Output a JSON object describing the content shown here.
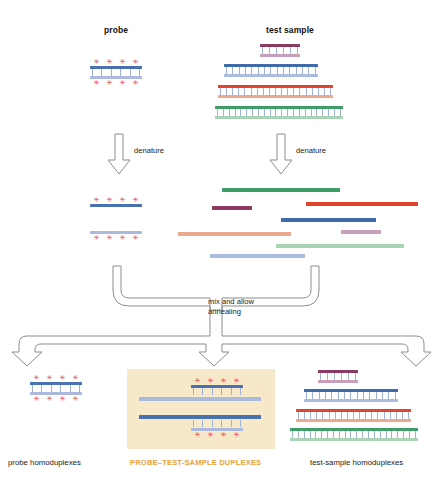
{
  "diagram": {
    "title_probe": "probe",
    "title_test_sample": "test sample",
    "denature_label_left": "denature",
    "denature_label_right": "denature",
    "mix_label_line1": "mix and allow",
    "mix_label_line2": "annealing",
    "result_label_left": "probe homoduplexes",
    "result_label_center": "PROBE–TEST-SAMPLE DUPLEXES",
    "result_label_right": "test-sample homoduplexes"
  },
  "colors": {
    "probe_top_strand": "#4a72b0",
    "probe_bottom_strand": "#aab9dd",
    "star_marker": "#e0484a",
    "rung": "#9fb4d4",
    "purple_top": "#8b3a62",
    "purple_bottom": "#c9a0bc",
    "blue_top": "#3f6bab",
    "blue_bottom": "#a9bcdf",
    "red_top": "#e0452c",
    "red_bottom": "#eda88e",
    "green_top": "#3f9e68",
    "green_bottom": "#a8d3b4",
    "arrow_stroke": "#8d8d8d",
    "highlight_panel_bg": "#f6e8c8",
    "highlight_label": "#e8a33d",
    "text": "#1a1a1a",
    "background": "#ffffff"
  },
  "top": {
    "probe_duplex": {
      "name": "probe-duplex",
      "width": 52,
      "rungs": 6,
      "stars_top": 4,
      "stars_bottom": 4
    },
    "test_sample_duplexes": [
      {
        "name": "purple-duplex",
        "width": 40,
        "rungs": 6,
        "top_color": "purple_top",
        "bottom_color": "purple_bottom"
      },
      {
        "name": "blue-duplex",
        "width": 94,
        "rungs": 15,
        "top_color": "blue_top",
        "bottom_color": "blue_bottom"
      },
      {
        "name": "red-duplex",
        "width": 115,
        "rungs": 19,
        "top_color": "red_top",
        "bottom_color": "red_bottom"
      },
      {
        "name": "green-duplex",
        "width": 128,
        "rungs": 22,
        "top_color": "green_top",
        "bottom_color": "green_bottom"
      }
    ]
  },
  "denatured": {
    "probe_strands": [
      {
        "name": "probe-top-single",
        "color": "probe_top_strand",
        "stars": 4,
        "stars_position": "above"
      },
      {
        "name": "probe-bottom-single",
        "color": "probe_bottom_strand",
        "stars": 4,
        "stars_position": "below"
      }
    ],
    "test_sample_strands": [
      {
        "name": "green-top-single",
        "color": "green_top",
        "x": 222,
        "y": 188,
        "width": 118
      },
      {
        "name": "purple-top-single",
        "color": "purple_top",
        "x": 212,
        "y": 206,
        "width": 40
      },
      {
        "name": "red-top-single",
        "color": "red_top",
        "x": 306,
        "y": 202,
        "width": 112
      },
      {
        "name": "blue-top-single",
        "color": "blue_top",
        "x": 281,
        "y": 218,
        "width": 95
      },
      {
        "name": "purple-bot-single",
        "color": "purple_bottom",
        "x": 341,
        "y": 230,
        "width": 40
      },
      {
        "name": "red-bot-single",
        "color": "red_bottom",
        "x": 178,
        "y": 232,
        "width": 113
      },
      {
        "name": "green-bot-single",
        "color": "green_bottom",
        "x": 276,
        "y": 244,
        "width": 128
      },
      {
        "name": "blue-bot-single",
        "color": "blue_bottom",
        "x": 210,
        "y": 254,
        "width": 95
      }
    ]
  },
  "results": {
    "probe_homoduplexes": [
      {
        "name": "probe-homoduplex",
        "width": 52,
        "rungs": 6,
        "stars_top": 4,
        "stars_bottom": 4
      }
    ],
    "hetero_duplexes": [
      {
        "name": "hetero-duplex-upper",
        "probe_strand_width": 52,
        "test_strand_width": 122,
        "rungs": 6,
        "stars": 4,
        "stars_position": "above"
      },
      {
        "name": "hetero-duplex-lower",
        "probe_strand_width": 52,
        "test_strand_width": 122,
        "rungs": 6,
        "stars": 4,
        "stars_position": "below"
      }
    ],
    "test_sample_homoduplexes": [
      {
        "name": "purple-homoduplex",
        "width": 40,
        "rungs": 6,
        "top_color": "purple_top",
        "bottom_color": "purple_bottom"
      },
      {
        "name": "blue-homoduplex",
        "width": 94,
        "rungs": 15,
        "top_color": "blue_top",
        "bottom_color": "blue_bottom"
      },
      {
        "name": "red-homoduplex",
        "width": 115,
        "rungs": 19,
        "top_color": "red_top",
        "bottom_color": "red_bottom"
      },
      {
        "name": "green-homoduplex",
        "width": 128,
        "rungs": 22,
        "top_color": "green_top",
        "bottom_color": "green_bottom"
      }
    ]
  }
}
